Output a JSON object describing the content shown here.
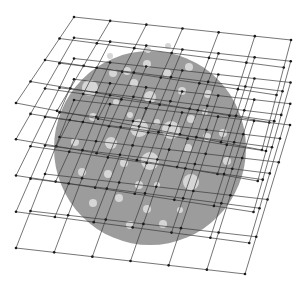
{
  "diagram": {
    "title": "",
    "colors": {
      "background": "#ffffff",
      "disc": "#9c9c9c",
      "inclusion": "#d6d6d6",
      "grid_line": "#3a3a3a",
      "grid_node": "#1a1a1a"
    },
    "lattice": {
      "layers": 5,
      "columns": 6,
      "rows": 4
    },
    "inclusion_count": 40
  }
}
